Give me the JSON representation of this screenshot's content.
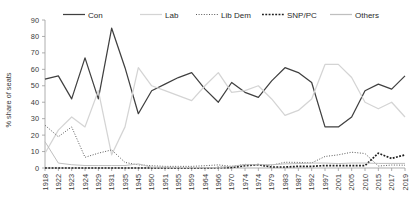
{
  "chart_data": {
    "type": "line",
    "title": "",
    "xlabel": "",
    "ylabel": "% share of seats",
    "ylim": [
      0,
      90
    ],
    "ytick_step": 10,
    "yticks": [
      "0",
      "10",
      "20",
      "30",
      "40",
      "50",
      "60",
      "70",
      "80",
      "90"
    ],
    "grid": false,
    "legend_position": "top",
    "categories": [
      "1918",
      "1922",
      "1923",
      "1924",
      "1929",
      "1931",
      "1935",
      "1945",
      "1950",
      "1951",
      "1955",
      "1959",
      "1964",
      "1966",
      "1970",
      "1974",
      "1974",
      "1979",
      "1983",
      "1987",
      "1992",
      "1997",
      "2001",
      "2005",
      "2010",
      "2015",
      "2017",
      "2019"
    ],
    "series": [
      {
        "name": "Con",
        "color": "#404040",
        "style": "solid",
        "width": 1.25,
        "values": [
          54,
          56,
          42,
          67,
          42,
          85,
          61,
          33,
          47,
          51,
          55,
          58,
          48,
          40,
          52,
          46,
          43,
          53,
          61,
          58,
          52,
          25,
          25,
          31,
          47,
          51,
          48,
          56
        ]
      },
      {
        "name": "Lab",
        "color": "#d4d4d4",
        "style": "solid",
        "width": 1.25,
        "values": [
          9,
          23,
          31,
          25,
          47,
          8,
          25,
          61,
          50,
          47,
          44,
          41,
          50,
          58,
          46,
          47,
          50,
          42,
          32,
          35,
          42,
          63,
          63,
          55,
          40,
          36,
          40,
          31
        ]
      },
      {
        "name": "Lib Dem",
        "color": "#5a5a5a",
        "style": "dotted",
        "width": 1.0,
        "values": [
          26,
          19,
          25,
          6.5,
          9,
          11,
          3.4,
          1.9,
          1.4,
          1,
          1,
          1,
          1.4,
          1.9,
          1,
          2.2,
          2,
          1.7,
          3.5,
          3.4,
          3.1,
          7,
          8,
          9.6,
          8.8,
          1.2,
          1.8,
          1.7
        ]
      },
      {
        "name": "SNP/PC",
        "color": "#1f1f1f",
        "style": "dashed-thick",
        "width": 1.7,
        "values": [
          0,
          0,
          0,
          0,
          0,
          0,
          0,
          0,
          0,
          0,
          0,
          0,
          0,
          0.2,
          0.3,
          1.4,
          2,
          0.6,
          0.6,
          1,
          1,
          1.5,
          1.4,
          1.4,
          1.4,
          9,
          5.8,
          8
        ]
      },
      {
        "name": "Others",
        "color": "#bfbfbf",
        "style": "solid",
        "width": 1.0,
        "values": [
          16,
          3,
          2,
          1.5,
          1.5,
          1.5,
          1.5,
          2.5,
          0.5,
          0.5,
          0.3,
          0.3,
          0.2,
          0.2,
          1,
          2,
          2,
          2,
          2.5,
          2.7,
          3,
          3,
          2.7,
          3,
          3,
          2.8,
          2.8,
          2.8
        ]
      }
    ],
    "legend": [
      {
        "label": "Con",
        "color": "#404040",
        "style": "solid"
      },
      {
        "label": "Lab",
        "color": "#d4d4d4",
        "style": "solid"
      },
      {
        "label": "Lib Dem",
        "color": "#5a5a5a",
        "style": "dotted"
      },
      {
        "label": "SNP/PC",
        "color": "#1f1f1f",
        "style": "dashed-thick"
      },
      {
        "label": "Others",
        "color": "#bfbfbf",
        "style": "solid"
      }
    ]
  }
}
